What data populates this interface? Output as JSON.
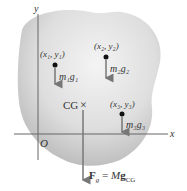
{
  "axes": {
    "x_label": "x",
    "y_label": "y",
    "origin_label": "O"
  },
  "particles": [
    {
      "coord_label": "(x₁, y₁)",
      "weight_label": "m₁g₁"
    },
    {
      "coord_label": "(x₂, y₂)",
      "weight_label": "m₂g₂"
    },
    {
      "coord_label": "(x₃, y₃)",
      "weight_label": "m₃g₃"
    }
  ],
  "center_of_gravity": {
    "label": "CG",
    "marker": "×"
  },
  "resultant": {
    "label": "F_g = Mg_CG",
    "lhs": "F",
    "lhs_sub": "g",
    "equals": "=",
    "rhs_coef": "M",
    "rhs_vec": "g",
    "rhs_sub": "CG"
  },
  "colors": {
    "blob_light": "#f2f2f2",
    "blob_dark": "#b8b8b8",
    "axis": "#666666",
    "arrow": "#777777",
    "dot": "#111111"
  }
}
